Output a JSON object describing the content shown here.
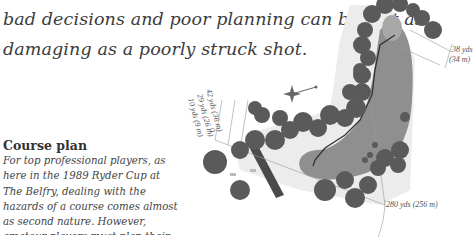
{
  "intro": {
    "line1": "bad decisions and poor planning can be just as",
    "line2": "damaging as a poorly struck shot."
  },
  "course_plan": {
    "title": "Course plan",
    "lines": [
      "For top professional players, as",
      "here in the 1989 Ryder Cup at",
      "The Belfry, dealing with the",
      "hazards of a course comes almost",
      "as second nature. However,",
      "amateur players must plan their"
    ]
  },
  "diagram": {
    "distance_labels": {
      "d42": "42 yds (36 m)",
      "d29": "29 yds (26 m)",
      "d10": "10 yds (9 m)",
      "zero": "0",
      "green_width_yds": "38 yds",
      "green_width_m": "(34 m)",
      "hole_length": "280 yds (256 m)"
    },
    "colors": {
      "trees": "#5a5a5a",
      "fairway": "#8f8f8f",
      "rough": "#e6e6e6",
      "water": "#4a4a4a",
      "path": "#3a3a3a",
      "green": "#a8a8a8"
    }
  }
}
